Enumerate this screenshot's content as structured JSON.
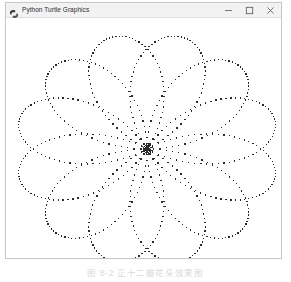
{
  "window": {
    "title": "Python Turtle Graphics",
    "icon": "python-turtle-icon",
    "controls": {
      "minimize_label": "Minimize",
      "maximize_label": "Maximize",
      "close_label": "Close"
    }
  },
  "caption": {
    "text": "图 8-2   正十二瓣花朵效果图"
  },
  "chart_data": {
    "type": "line",
    "title": "",
    "subtitle": "",
    "xlabel": "",
    "ylabel": "",
    "grid": false,
    "legend": null,
    "render": {
      "style": "dotted",
      "dot_color": "#2a2a2a",
      "dot_size_px": 1.3,
      "background": "#ffffff",
      "center_x": 141,
      "center_y": 131,
      "clipped_edges": [
        "left",
        "right"
      ]
    },
    "curve": {
      "name": "rose-curve",
      "equation": "r = a * cos(k * theta)",
      "petals": 12,
      "petal_radius_x": 132,
      "petal_radius_y": 116,
      "petal_half_width_deg": 15,
      "start_angle_deg": 15,
      "samples_per_petal": 64,
      "theta_range_deg": [
        0,
        360
      ]
    },
    "x": [],
    "values": []
  }
}
